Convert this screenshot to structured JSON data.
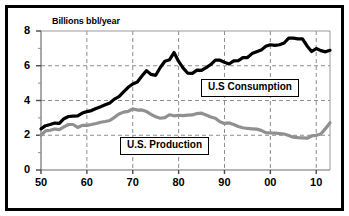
{
  "figure": {
    "axis_label_y": "Billions bbl/year",
    "border_color": "#000000",
    "background": "#ffffff"
  },
  "legend": {
    "consumption_label": "U.S Consumption",
    "production_label": "U.S. Production"
  },
  "chart_data": {
    "type": "line",
    "title": "",
    "subtitle": "",
    "xlabel": "",
    "ylabel": "Billions bbl/year",
    "xlim": [
      1950,
      2013
    ],
    "ylim": [
      0,
      8
    ],
    "yticks": [
      0,
      2,
      4,
      6,
      8
    ],
    "ytick_labels": [
      "0",
      "2",
      "4",
      "6",
      "8"
    ],
    "yminor_ticks": [
      1,
      3,
      5,
      7
    ],
    "xticks": [
      1950,
      1960,
      1970,
      1980,
      1990,
      2000,
      2010
    ],
    "xtick_labels": [
      "50",
      "60",
      "70",
      "80",
      "90",
      "00",
      "10"
    ],
    "grid": "dashed gridlines at y=2,4,6 and x=1960,1970,1980,1990,2000,2010",
    "legend_position": "inside-plot",
    "x": [
      1950,
      1951,
      1952,
      1953,
      1954,
      1955,
      1956,
      1957,
      1958,
      1959,
      1960,
      1961,
      1962,
      1963,
      1964,
      1965,
      1966,
      1967,
      1968,
      1969,
      1970,
      1971,
      1972,
      1973,
      1974,
      1975,
      1976,
      1977,
      1978,
      1979,
      1980,
      1981,
      1982,
      1983,
      1984,
      1985,
      1986,
      1987,
      1988,
      1989,
      1990,
      1991,
      1992,
      1993,
      1994,
      1995,
      1996,
      1997,
      1998,
      1999,
      2000,
      2001,
      2002,
      2003,
      2004,
      2005,
      2006,
      2007,
      2008,
      2009,
      2010,
      2011,
      2012,
      2013
    ],
    "series": [
      {
        "name": "U.S Consumption",
        "color": "#000000",
        "linewidth": 3.2,
        "values": [
          2.37,
          2.55,
          2.62,
          2.7,
          2.68,
          2.95,
          3.08,
          3.1,
          3.12,
          3.28,
          3.36,
          3.42,
          3.54,
          3.64,
          3.75,
          3.86,
          4.08,
          4.22,
          4.49,
          4.76,
          4.95,
          5.06,
          5.41,
          5.72,
          5.5,
          5.45,
          5.9,
          6.26,
          6.34,
          6.76,
          6.25,
          5.86,
          5.57,
          5.56,
          5.75,
          5.73,
          5.89,
          6.07,
          6.33,
          6.32,
          6.2,
          6.1,
          6.28,
          6.29,
          6.47,
          6.47,
          6.7,
          6.8,
          6.9,
          7.12,
          7.21,
          7.17,
          7.21,
          7.31,
          7.59,
          7.59,
          7.55,
          7.55,
          7.14,
          6.82,
          6.99,
          6.87,
          6.8,
          6.89
        ]
      },
      {
        "name": "U.S. Production",
        "color": "#909090",
        "linewidth": 3.2,
        "values": [
          2.0,
          2.25,
          2.29,
          2.36,
          2.32,
          2.48,
          2.62,
          2.62,
          2.45,
          2.57,
          2.57,
          2.62,
          2.68,
          2.75,
          2.79,
          2.85,
          3.03,
          3.22,
          3.33,
          3.37,
          3.52,
          3.45,
          3.46,
          3.36,
          3.2,
          3.06,
          2.98,
          3.01,
          3.18,
          3.12,
          3.15,
          3.13,
          3.16,
          3.17,
          3.25,
          3.27,
          3.17,
          3.05,
          2.98,
          2.78,
          2.68,
          2.71,
          2.62,
          2.5,
          2.43,
          2.39,
          2.37,
          2.35,
          2.28,
          2.15,
          2.13,
          2.12,
          2.1,
          2.07,
          1.98,
          1.89,
          1.86,
          1.85,
          1.83,
          1.96,
          2.0,
          2.07,
          2.38,
          2.72
        ]
      }
    ]
  }
}
